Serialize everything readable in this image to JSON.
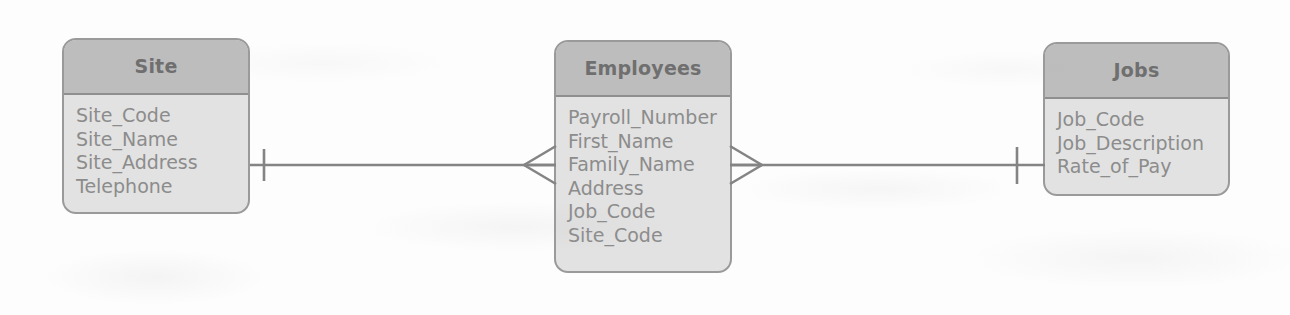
{
  "diagram": {
    "notation": "crow's foot",
    "entities": [
      {
        "id": "site",
        "name": "Site",
        "attributes": [
          "Site_Code",
          "Site_Name",
          "Site_Address",
          "Telephone"
        ]
      },
      {
        "id": "employees",
        "name": "Employees",
        "attributes": [
          "Payroll_Number",
          "First_Name",
          "Family_Name",
          "Address",
          "Job_Code",
          "Site_Code"
        ]
      },
      {
        "id": "jobs",
        "name": "Jobs",
        "attributes": [
          "Job_Code",
          "Job_Description",
          "Rate_of_Pay"
        ]
      }
    ],
    "relationships": [
      {
        "id": "site-employees",
        "from": "Site",
        "to": "Employees",
        "from_cardinality": "one",
        "to_cardinality": "many",
        "label": ""
      },
      {
        "id": "employees-jobs",
        "from": "Employees",
        "to": "Jobs",
        "from_cardinality": "many",
        "to_cardinality": "one",
        "label": ""
      }
    ],
    "colors": {
      "header_fill": "#bdbdbd",
      "body_fill": "#e2e2e2",
      "border": "#9a9a9a",
      "header_text": "#6f6f6f",
      "attribute_text": "#8c8c8c",
      "connector": "#848484",
      "background": "#fdfdfd"
    }
  }
}
